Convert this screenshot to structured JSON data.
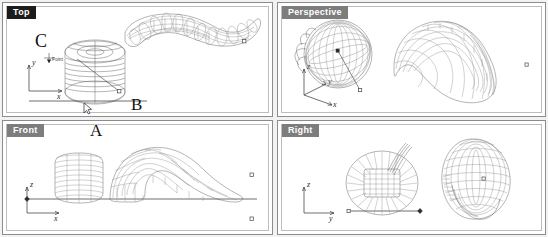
{
  "app": {
    "type": "cad-viewport-grid",
    "background": "#f2f2f2",
    "accent_label_dark": "#1c1c1c",
    "accent_label_grey": "#7d7d7d",
    "wire_color": "#5a5a5a"
  },
  "viewports": {
    "top_left": {
      "label": "Top",
      "label_style": "dark"
    },
    "top_right": {
      "label": "Perspective",
      "label_style": "grey"
    },
    "bottom_left": {
      "label": "Front",
      "label_style": "grey"
    },
    "bottom_right": {
      "label": "Right",
      "label_style": "grey"
    }
  },
  "axes": {
    "top": {
      "up": "y",
      "right": "x"
    },
    "perspective": {
      "up": "z",
      "mid": "y",
      "right": "x"
    },
    "front": {
      "up": "z",
      "right": "x"
    },
    "right": {
      "up": "z",
      "right": "y"
    }
  },
  "annotations": {
    "a": "A",
    "b": "B",
    "c": "C",
    "tooltip": "Point"
  },
  "objects": {
    "cylinder": "barrel-wireframe",
    "blob": "bent-tube-wireframe"
  }
}
